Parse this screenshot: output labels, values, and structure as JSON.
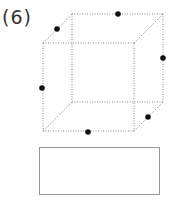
{
  "problem": {
    "label": "(6)"
  },
  "cube": {
    "edge_color": "#888888",
    "dot_color": "#111111",
    "front": {
      "tl": [
        43,
        43
      ],
      "tr": [
        134,
        43
      ],
      "bl": [
        43,
        131
      ],
      "br": [
        134,
        131
      ]
    },
    "back": {
      "tl": [
        72,
        14
      ],
      "tr": [
        163,
        14
      ],
      "bl": [
        72,
        102
      ],
      "br": [
        163,
        102
      ]
    },
    "dots": [
      {
        "name": "dot-top-left-edge",
        "x": 57,
        "y": 29
      },
      {
        "name": "dot-back-top-edge",
        "x": 118,
        "y": 14
      },
      {
        "name": "dot-back-right-edge",
        "x": 163,
        "y": 58
      },
      {
        "name": "dot-front-left-edge",
        "x": 42,
        "y": 88
      },
      {
        "name": "dot-bottom-right-edge",
        "x": 148,
        "y": 117
      },
      {
        "name": "dot-front-bottom-edge",
        "x": 88,
        "y": 132
      }
    ]
  },
  "answer_box": {
    "x": 39,
    "y": 147,
    "width": 120,
    "height": 47,
    "border_color": "#999999",
    "value": ""
  }
}
